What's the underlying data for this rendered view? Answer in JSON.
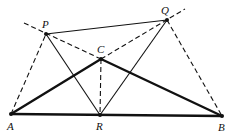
{
  "diagram": {
    "points": {
      "P": {
        "label": "P",
        "x": 46,
        "y": 34
      },
      "Q": {
        "label": "Q",
        "x": 167,
        "y": 20
      },
      "C": {
        "label": "C",
        "x": 101,
        "y": 59
      },
      "A": {
        "label": "A",
        "x": 11,
        "y": 114
      },
      "R": {
        "label": "R",
        "x": 100,
        "y": 115
      },
      "B": {
        "label": "B",
        "x": 222,
        "y": 116
      }
    },
    "thick_segments": [
      "AB",
      "AC",
      "CB"
    ],
    "thin_segments": [
      "PQ",
      "PR",
      "QR"
    ],
    "dashed_segments": [
      "AP (extended)",
      "PC",
      "CQ (extended)",
      "CR",
      "QB"
    ],
    "colors": {
      "line": "#111111",
      "background": "#ffffff"
    }
  }
}
